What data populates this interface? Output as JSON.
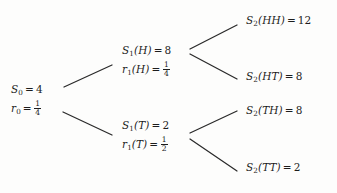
{
  "figure": {
    "type": "binomial-tree",
    "background_color": "#fdfdfc",
    "edge_color": "#2a2a2a",
    "text_color": "#1d1d1d"
  },
  "nodes": {
    "root": {
      "id": "S0",
      "price_symbol": "S",
      "price_subscript": "0",
      "price_value": "4",
      "rate_symbol": "r",
      "rate_subscript": "0",
      "rate_numerator": "1",
      "rate_denominator": "4",
      "equals": "="
    },
    "head": {
      "id": "S1(H)",
      "price_symbol": "S",
      "price_subscript": "1",
      "price_argument": "(H)",
      "price_value": "8",
      "rate_symbol": "r",
      "rate_subscript": "1",
      "rate_argument": "(H)",
      "rate_numerator": "1",
      "rate_denominator": "4",
      "equals": "="
    },
    "tail": {
      "id": "S1(T)",
      "price_symbol": "S",
      "price_subscript": "1",
      "price_argument": "(T)",
      "price_value": "2",
      "rate_symbol": "r",
      "rate_subscript": "1",
      "rate_argument": "(T)",
      "rate_numerator": "1",
      "rate_denominator": "2",
      "equals": "="
    }
  },
  "leaves": [
    {
      "id": "S2(HH)",
      "symbol": "S",
      "subscript": "2",
      "argument": "(HH)",
      "equals": "=",
      "value": "12"
    },
    {
      "id": "S2(HT)",
      "symbol": "S",
      "subscript": "2",
      "argument": "(HT)",
      "equals": "=",
      "value": "8"
    },
    {
      "id": "S2(TH)",
      "symbol": "S",
      "subscript": "2",
      "argument": "(TH)",
      "equals": "=",
      "value": "8"
    },
    {
      "id": "S2(TT)",
      "symbol": "S",
      "subscript": "2",
      "argument": "(TT)",
      "equals": "=",
      "value": "2"
    }
  ],
  "edges": [
    {
      "name": "root-to-head",
      "x1": 64,
      "y1": 87,
      "x2": 112,
      "y2": 65
    },
    {
      "name": "root-to-tail",
      "x1": 63,
      "y1": 112,
      "x2": 112,
      "y2": 135
    },
    {
      "name": "head-to-hh",
      "x1": 190,
      "y1": 49,
      "x2": 237,
      "y2": 25
    },
    {
      "name": "head-to-ht",
      "x1": 190,
      "y1": 54,
      "x2": 237,
      "y2": 79
    },
    {
      "name": "tail-to-th",
      "x1": 190,
      "y1": 133,
      "x2": 237,
      "y2": 111
    },
    {
      "name": "tail-to-tt",
      "x1": 190,
      "y1": 139,
      "x2": 237,
      "y2": 171
    }
  ]
}
